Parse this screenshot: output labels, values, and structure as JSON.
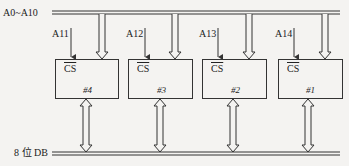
{
  "address_bus": {
    "label": "A0~A10"
  },
  "data_bus": {
    "label": "8 位 DB"
  },
  "chips": [
    {
      "id": "#4",
      "cs_label": "CS",
      "select_line": "A11"
    },
    {
      "id": "#3",
      "cs_label": "CS",
      "select_line": "A12"
    },
    {
      "id": "#2",
      "cs_label": "CS",
      "select_line": "A13"
    },
    {
      "id": "#1",
      "cs_label": "CS",
      "select_line": "A14"
    }
  ],
  "colors": {
    "line": "#333333",
    "background": "#f4f3f1"
  }
}
